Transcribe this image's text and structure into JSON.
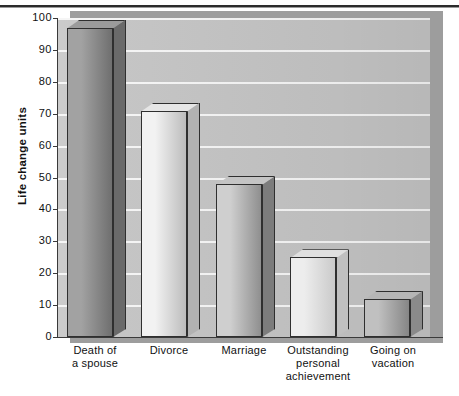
{
  "figure": {
    "type": "3d-bar-chart",
    "background_color": "#ffffff",
    "plot_background_color": "#c3c3c3",
    "gridline_color": "#f4f4f4",
    "axis_color": "#3a3a3a"
  },
  "chart_data": {
    "type": "bar",
    "title": "",
    "subtitle": "",
    "xlabel": "",
    "ylabel": "Life change units",
    "ylim": [
      0,
      100
    ],
    "ytick_labels": [
      "100",
      "90",
      "80",
      "70",
      "60",
      "50",
      "40",
      "30",
      "20",
      "10",
      "0"
    ],
    "ytick_values": [
      100,
      90,
      80,
      70,
      60,
      50,
      40,
      30,
      20,
      10,
      0
    ],
    "grid": true,
    "legend": null,
    "legend_position": "none",
    "categories": [
      "Death of\na spouse",
      "Divorce",
      "Marriage",
      "Outstanding\npersonal\nachievement",
      "Going on\nvacation"
    ],
    "category_lines": [
      [
        "Death of",
        "a spouse"
      ],
      [
        "Divorce"
      ],
      [
        "Marriage"
      ],
      [
        "Outstanding",
        "personal",
        "achievement"
      ],
      [
        "Going on",
        "vacation"
      ]
    ],
    "values": [
      97,
      71,
      48,
      25,
      12
    ],
    "bar_colors": [
      "#8d8d8d",
      "#e2e2e2",
      "#b0b0b0",
      "#dedede",
      "#a5a5a5"
    ]
  },
  "bars": [
    {
      "label": "Death of a spouse",
      "value": 97,
      "face_light": "#a2a2a2",
      "face_dark": "#6f6f6f",
      "top_color": "#9b9b9b",
      "side_color": "#6a6a6a"
    },
    {
      "label": "Divorce",
      "value": 71,
      "face_light": "#f2f2f2",
      "face_dark": "#bcbcbc",
      "top_color": "#e6e6e6",
      "side_color": "#b2b2b2"
    },
    {
      "label": "Marriage",
      "value": 48,
      "face_light": "#cfcfcf",
      "face_dark": "#8f8f8f",
      "top_color": "#c4c4c4",
      "side_color": "#7c7c7c"
    },
    {
      "label": "Outstanding personal achievement",
      "value": 25,
      "face_light": "#ededed",
      "face_dark": "#cacaca",
      "top_color": "#e0e0e0",
      "side_color": "#c0c0c0"
    },
    {
      "label": "Going on vacation",
      "value": 12,
      "face_light": "#c0c0c0",
      "face_dark": "#868686",
      "top_color": "#b6b6b6",
      "side_color": "#8a8a8a"
    }
  ],
  "axis_labels": {
    "y_title": "Life change units"
  }
}
